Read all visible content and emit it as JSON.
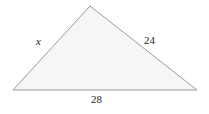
{
  "figure": {
    "name": "triangle-figure",
    "type": "geometry-diagram",
    "shape": "triangle",
    "background_color": "#ffffff",
    "fill_color": "#f6f6f6",
    "stroke_color": "#9b9b9b",
    "stroke_width_px": 1,
    "text_color": "#231f20",
    "vertices": {
      "bottom_left": {
        "x": 13,
        "y": 90
      },
      "apex": {
        "x": 90,
        "y": 6
      },
      "bottom_right": {
        "x": 197,
        "y": 90
      }
    },
    "labels": {
      "left_side": "x",
      "right_side": "24",
      "base": "28"
    }
  }
}
